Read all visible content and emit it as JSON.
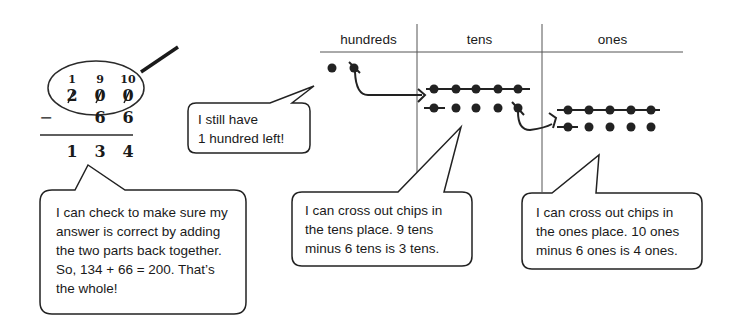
{
  "algorithm": {
    "regroup_digits": [
      "1",
      "9",
      "10"
    ],
    "top_digits": [
      "2",
      "0",
      "0"
    ],
    "subtract_sign": "−",
    "bottom_digits": [
      "",
      "6",
      "6"
    ],
    "result_digits": [
      "1",
      "3",
      "4"
    ]
  },
  "chart_table": {
    "headers": [
      "hundreds",
      "tens",
      "ones"
    ],
    "hundreds_chips": 2,
    "hundreds_crossed": 1,
    "tens_chips": 10,
    "tens_crossed": 6,
    "ones_chips": 10,
    "ones_crossed": 6
  },
  "bubbles": {
    "hundred_left": [
      "I still have",
      "1 hundred left!"
    ],
    "check": [
      "I can check to make sure my",
      "answer is correct by adding",
      "the two parts back together.",
      "So, 134 + 66 = 200.  That’s",
      "the whole!"
    ],
    "tens": [
      "I can cross out chips in",
      "the tens place.  9 tens",
      "minus 6 tens is 3 tens."
    ],
    "ones": [
      "I can cross out chips in",
      "the ones place.  10 ones",
      "minus 6 ones is 4 ones."
    ]
  }
}
